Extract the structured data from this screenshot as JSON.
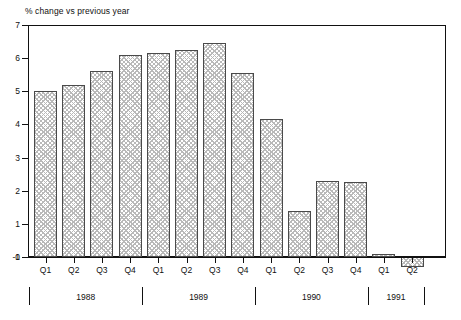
{
  "chart_data": {
    "type": "bar",
    "title": "",
    "ylabel": "% change vs previous year",
    "xlabel": "",
    "ylim": [
      -1,
      7
    ],
    "yticks": [
      7,
      6,
      5,
      4,
      3,
      2,
      1,
      0,
      -1
    ],
    "ytick_labels": [
      "7",
      "6",
      "5",
      "4",
      "3",
      "2",
      "1",
      "0",
      "-1"
    ],
    "grid": false,
    "legend": "none",
    "categories": [
      "Q1",
      "Q2",
      "Q3",
      "Q4",
      "Q1",
      "Q2",
      "Q3",
      "Q4",
      "Q1",
      "Q2",
      "Q3",
      "Q4",
      "Q1",
      "Q2"
    ],
    "values": [
      5.0,
      5.2,
      5.6,
      6.1,
      6.15,
      6.25,
      6.45,
      5.55,
      4.15,
      1.4,
      2.3,
      2.25,
      0.1,
      -0.3
    ],
    "group_labels": [
      "1988",
      "1989",
      "1990",
      "1991"
    ],
    "groups": [
      {
        "label": "1988",
        "quarters": [
          "Q1",
          "Q2",
          "Q3",
          "Q4"
        ],
        "values": [
          5.0,
          5.2,
          5.6,
          6.1
        ]
      },
      {
        "label": "1989",
        "quarters": [
          "Q1",
          "Q2",
          "Q3",
          "Q4"
        ],
        "values": [
          6.15,
          6.25,
          6.45,
          5.55
        ]
      },
      {
        "label": "1990",
        "quarters": [
          "Q1",
          "Q2",
          "Q3",
          "Q4"
        ],
        "values": [
          4.15,
          1.4,
          2.3,
          2.25
        ]
      },
      {
        "label": "1991",
        "quarters": [
          "Q1",
          "Q2"
        ],
        "values": [
          0.1,
          -0.3
        ]
      }
    ],
    "colors": {
      "bar_fill": "#ffffff",
      "bar_hatch": "#b9b9b9",
      "bar_edge": "#4a4a4a",
      "axis": "#111111",
      "background": "#ffffff"
    }
  }
}
